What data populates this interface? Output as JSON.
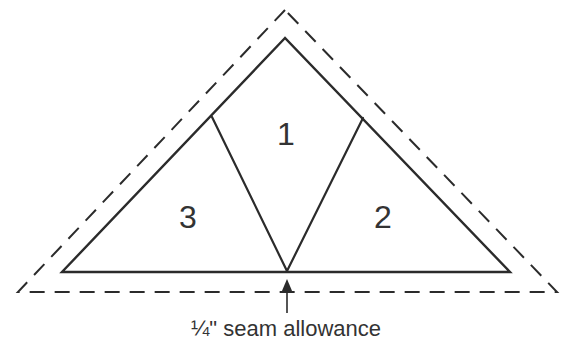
{
  "diagram": {
    "pieces": [
      {
        "label": "1"
      },
      {
        "label": "2"
      },
      {
        "label": "3"
      }
    ],
    "caption": "¼\" seam allowance",
    "colors": {
      "line": "#2b2b2b",
      "text": "#333333",
      "background": "#ffffff"
    }
  }
}
